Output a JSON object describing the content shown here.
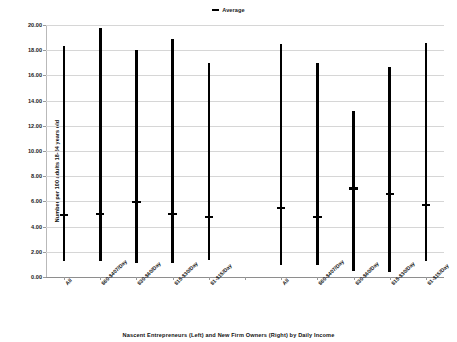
{
  "chart_data": {
    "type": "bar",
    "title": "",
    "subtitle": "",
    "xlabel": "Nascent Entrepreneurs (Left) and New Firm Owners (Right) by Daily Income",
    "ylabel": "Number per 100 adults 18-64 years old",
    "ylim": [
      0,
      20
    ],
    "ytick_step": 2,
    "ytick_labels": [
      "0.00",
      "2.00",
      "4.00",
      "6.00",
      "8.00",
      "10.00",
      "12.00",
      "14.00",
      "16.00",
      "18.00",
      "20.00"
    ],
    "ytick_values": [
      0,
      2,
      4,
      6,
      8,
      10,
      12,
      14,
      16,
      18,
      20
    ],
    "grid": true,
    "legend": {
      "position": "top-center",
      "entries": [
        {
          "label": "Average",
          "marker": "dash",
          "color": "#000000"
        }
      ]
    },
    "groups": [
      {
        "name": "Nascent Entrepreneurs (Left)"
      },
      {
        "name": "New Firm Owners (Right)"
      }
    ],
    "categories": [
      "All",
      "$60-$407/Day",
      "$30-$60/Day",
      "$15-$30/Day",
      "$1-$15/Day",
      "",
      "All",
      "$60-$407/Day",
      "$30-$60/Day",
      "$15-$30/Day",
      "$1-$15/Day"
    ],
    "series": [
      {
        "name": "Range (Min to Max)",
        "type": "range",
        "color": "#000000",
        "points": [
          {
            "category": "All",
            "group": "Nascent Entrepreneurs (Left)",
            "min": 1.25,
            "max": 18.3,
            "average": 4.9
          },
          {
            "category": "$60-$407/Day",
            "group": "Nascent Entrepreneurs (Left)",
            "min": 1.25,
            "max": 19.8,
            "average": 4.98
          },
          {
            "category": "$30-$60/Day",
            "group": "Nascent Entrepreneurs (Left)",
            "min": 1.1,
            "max": 17.98,
            "average": 5.92
          },
          {
            "category": "$15-$30/Day",
            "group": "Nascent Entrepreneurs (Left)",
            "min": 1.08,
            "max": 18.9,
            "average": 4.98
          },
          {
            "category": "$1-$15/Day",
            "group": "Nascent Entrepreneurs (Left)",
            "min": 1.35,
            "max": 17.02,
            "average": 4.78
          },
          {
            "category": "",
            "group": "",
            "min": null,
            "max": null,
            "average": null
          },
          {
            "category": "All",
            "group": "New Firm Owners (Right)",
            "min": 0.98,
            "max": 18.52,
            "average": 5.5
          },
          {
            "category": "$60-$407/Day",
            "group": "New Firm Owners (Right)",
            "min": 0.97,
            "max": 17.02,
            "average": 4.78
          },
          {
            "category": "$30-$60/Day",
            "group": "New Firm Owners (Right)",
            "min": 0.45,
            "max": 13.15,
            "average": 7.02
          },
          {
            "category": "$15-$30/Day",
            "group": "New Firm Owners (Right)",
            "min": 0.4,
            "max": 16.7,
            "average": 6.58
          },
          {
            "category": "$1-$15/Day",
            "group": "New Firm Owners (Right)",
            "min": 1.25,
            "max": 18.6,
            "average": 5.72
          }
        ]
      }
    ]
  },
  "colors": {
    "series": "#000000",
    "grid": "#d6d6d6",
    "axis": "#8e8e8e",
    "text": "#111111",
    "background": "#ffffff"
  }
}
